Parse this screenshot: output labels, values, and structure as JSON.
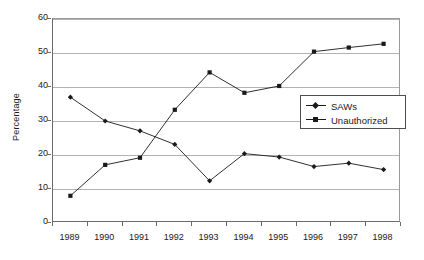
{
  "chart_data": {
    "type": "line",
    "title": "",
    "xlabel": "",
    "ylabel": "Percentage",
    "categories": [
      "1989",
      "1990",
      "1991",
      "1992",
      "1993",
      "1994",
      "1995",
      "1996",
      "1997",
      "1998"
    ],
    "series": [
      {
        "name": "SAWs",
        "marker": "diamond",
        "color": "#1a1a1a",
        "values": [
          37.0,
          30.0,
          27.1,
          23.1,
          12.4,
          20.4,
          19.4,
          16.6,
          17.6,
          15.7
        ]
      },
      {
        "name": "Unauthorized",
        "marker": "square",
        "color": "#1a1a1a",
        "values": [
          8.0,
          17.1,
          19.2,
          33.3,
          44.3,
          38.3,
          40.3,
          50.4,
          51.6,
          52.7
        ]
      }
    ],
    "ylim": [
      0,
      60
    ],
    "yticks": [
      0,
      10,
      20,
      30,
      40,
      50,
      60
    ],
    "ytick_labels": [
      "0",
      "10",
      "20",
      "30",
      "40",
      "50",
      "60"
    ],
    "grid": "horizontal",
    "legend_position": "inside-right",
    "legend_entries": [
      "SAWs",
      "Unauthorized"
    ],
    "gridline_color": "#b3b3b3",
    "axis_color": "#6b6b6b",
    "background": "#ffffff"
  }
}
